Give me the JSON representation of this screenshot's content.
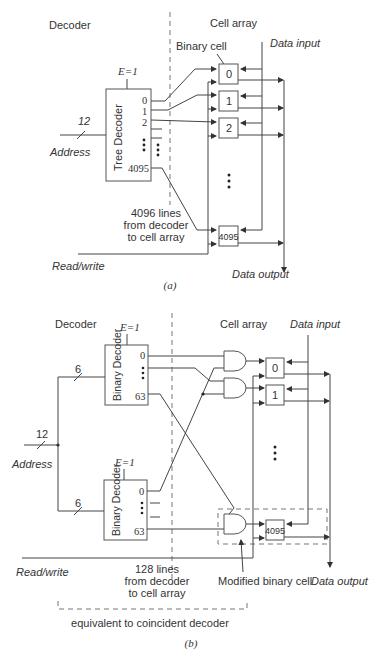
{
  "diagram_a": {
    "decoder_heading": "Decoder",
    "cell_array_heading": "Cell array",
    "binary_cell_label": "Binary cell",
    "data_input_label": "Data input",
    "data_output_label": "Data output",
    "enable_label": "E=1",
    "decoder_box_label": "Tree Decoder",
    "address_label": "Address",
    "address_width": "12",
    "decoder_outputs": [
      "0",
      "1",
      "2",
      "4095"
    ],
    "cells": [
      "0",
      "1",
      "2",
      "4095"
    ],
    "lines_note": [
      "4096 lines",
      "from decoder",
      "to cell array"
    ],
    "read_write_label": "Read/write",
    "caption": "(a)"
  },
  "diagram_b": {
    "decoder_heading": "Decoder",
    "cell_array_heading": "Cell array",
    "data_input_label": "Data input",
    "data_output_label": "Data output",
    "enable_label_top": "E=1",
    "enable_label_bottom": "E=1",
    "decoder_box_label_top": "Binary Decoder",
    "decoder_box_label_bottom": "Binary Decoder",
    "decoder_outputs_top": [
      "0",
      "63"
    ],
    "decoder_outputs_bottom": [
      "0",
      "63"
    ],
    "address_label": "Address",
    "address_width": "12",
    "split_width_top": "6",
    "split_width_bottom": "6",
    "cells": [
      "0",
      "1",
      "4095"
    ],
    "lines_note": [
      "128  lines",
      "from decoder",
      "to cell array"
    ],
    "modified_cell_label": "Modified binary cell",
    "read_write_label": "Read/write",
    "equivalent_label": "equivalent to coincident decoder",
    "caption": "(b)"
  }
}
